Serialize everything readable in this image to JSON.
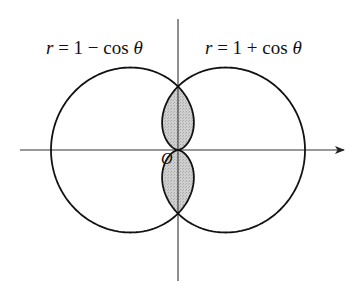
{
  "figure": {
    "origin": {
      "x": 178,
      "y": 150,
      "label": "O"
    },
    "scale_a": 63.5,
    "x_axis": {
      "from": 20,
      "to": 344,
      "arrow": true
    },
    "y_axis": {
      "from": 19,
      "to": 281,
      "arrow": false
    },
    "colors": {
      "stroke": "#111111",
      "axis": "#333333",
      "shade": "#c8c8c8",
      "background": "#ffffff"
    },
    "curves": [
      {
        "name": "left-cardioid",
        "equation_parts": {
          "var": "r",
          "eq": " = 1 − cos ",
          "theta": "θ"
        },
        "label_pos": {
          "left": 46,
          "top": 38
        }
      },
      {
        "name": "right-cardioid",
        "equation_parts": {
          "var": "r",
          "eq": " = 1 + cos ",
          "theta": "θ"
        },
        "label_pos": {
          "left": 205,
          "top": 38
        }
      }
    ],
    "shaded_region": "intersection of r = 1 − cos θ and r = 1 + cos θ"
  }
}
